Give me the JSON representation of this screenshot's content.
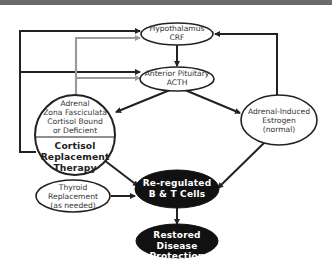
{
  "diagram": {
    "title": "",
    "colors": {
      "banner": "#6b6b6b",
      "line_dark": "#222222",
      "line_gray": "#9a9a9a",
      "node_fill_light": "#ffffff",
      "node_fill_dark": "#111111",
      "node_stroke": "#222222",
      "text_light_nodes": "#333333",
      "text_dark_nodes": "#ffffff"
    },
    "nodes": {
      "hypothalamus": {
        "line1": "Hypothalamus",
        "line2": "CRF"
      },
      "pituitary": {
        "line1": "Anterior Pituitary",
        "line2": "ACTH"
      },
      "adrenal": {
        "top_line1": "Adrenal",
        "top_line2": "Zona Fasciculata",
        "top_line3": "Cortisol Bound",
        "top_line4": "or Deficient",
        "bottom_line1": "Cortisol",
        "bottom_line2": "Replacement",
        "bottom_line3": "Therapy"
      },
      "estrogen": {
        "line1": "Adrenal-Induced",
        "line2": "Estrogen",
        "line3": "(normal)"
      },
      "thyroid": {
        "line1": "Thyroid",
        "line2": "Replacement",
        "line3": "(as needed)"
      },
      "bt_cells": {
        "line1": "Re-regulated",
        "line2": "B & T Cells"
      },
      "restored": {
        "line1": "Restored Disease",
        "line2": "Protection"
      }
    },
    "edges": [
      {
        "from": "adrenal",
        "to": "hypothalamus",
        "style": "dark",
        "kind": "feedback"
      },
      {
        "from": "adrenal",
        "to": "pituitary",
        "style": "dark",
        "kind": "feedback"
      },
      {
        "from": "cortisol_replacement",
        "to": "hypothalamus",
        "style": "gray",
        "kind": "feedback"
      },
      {
        "from": "cortisol_replacement",
        "to": "pituitary",
        "style": "gray",
        "kind": "feedback"
      },
      {
        "from": "estrogen",
        "to": "hypothalamus",
        "style": "dark",
        "kind": "feedback"
      },
      {
        "from": "hypothalamus",
        "to": "pituitary",
        "style": "dark"
      },
      {
        "from": "pituitary",
        "to": "adrenal",
        "style": "dark"
      },
      {
        "from": "pituitary",
        "to": "estrogen",
        "style": "dark"
      },
      {
        "from": "cortisol_replacement",
        "to": "bt_cells",
        "style": "dark"
      },
      {
        "from": "thyroid",
        "to": "bt_cells",
        "style": "dark"
      },
      {
        "from": "estrogen",
        "to": "bt_cells",
        "style": "dark"
      },
      {
        "from": "bt_cells",
        "to": "restored",
        "style": "dark"
      }
    ]
  }
}
